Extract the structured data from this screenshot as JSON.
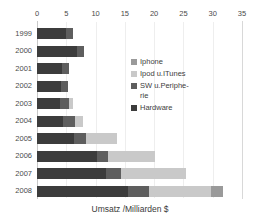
{
  "chart_data": {
    "type": "bar",
    "orientation": "horizontal",
    "stacked": true,
    "title": "Umsatz /Milliarden $",
    "title_position": "bottom",
    "xlabel": "Umsatz /Milliarden $",
    "ylabel": "",
    "xlim": [
      0,
      35
    ],
    "xticks": [
      0,
      5,
      10,
      15,
      20,
      25,
      30,
      35
    ],
    "xtick_labels": [
      "0",
      "5",
      "10",
      "15",
      "20",
      "25",
      "30",
      "35"
    ],
    "grid": "vertical-light",
    "legend_position": "inside-upper-right",
    "categories": [
      "1999",
      "2000",
      "2001",
      "2002",
      "2003",
      "2004",
      "2005",
      "2006",
      "2007",
      "2008"
    ],
    "series": [
      {
        "name": "Hardware",
        "color": "#3c3c3c",
        "values": [
          5.0,
          6.8,
          4.3,
          4.1,
          4.0,
          4.4,
          6.4,
          10.2,
          11.8,
          15.6
        ]
      },
      {
        "name": "SW u.Periphe-\nrie",
        "color": "#5e5e5e",
        "values": [
          1.1,
          1.2,
          1.1,
          1.2,
          1.5,
          2.1,
          1.9,
          1.9,
          2.5,
          3.5
        ]
      },
      {
        "name": "Ipod u.ITunes",
        "color": "#c9c9c9",
        "values": [
          0.0,
          0.0,
          0.0,
          0.0,
          0.7,
          1.4,
          5.4,
          8.1,
          11.2,
          10.6
        ]
      },
      {
        "name": "Iphone",
        "color": "#9a9a9a",
        "values": [
          0.0,
          0.0,
          0.0,
          0.0,
          0.0,
          0.0,
          0.0,
          0.0,
          0.0,
          2.0
        ]
      }
    ],
    "totals": [
      6.1,
      8.0,
      5.4,
      5.3,
      6.2,
      7.9,
      13.7,
      20.2,
      25.5,
      31.7
    ],
    "legend_entries": [
      {
        "label": "Iphone",
        "color": "#9a9a9a"
      },
      {
        "label": "Ipod u.ITunes",
        "color": "#c9c9c9"
      },
      {
        "label": "SW u.Periphe-\nrie",
        "color": "#5e5e5e"
      },
      {
        "label": "Hardware",
        "color": "#3c3c3c"
      }
    ]
  }
}
